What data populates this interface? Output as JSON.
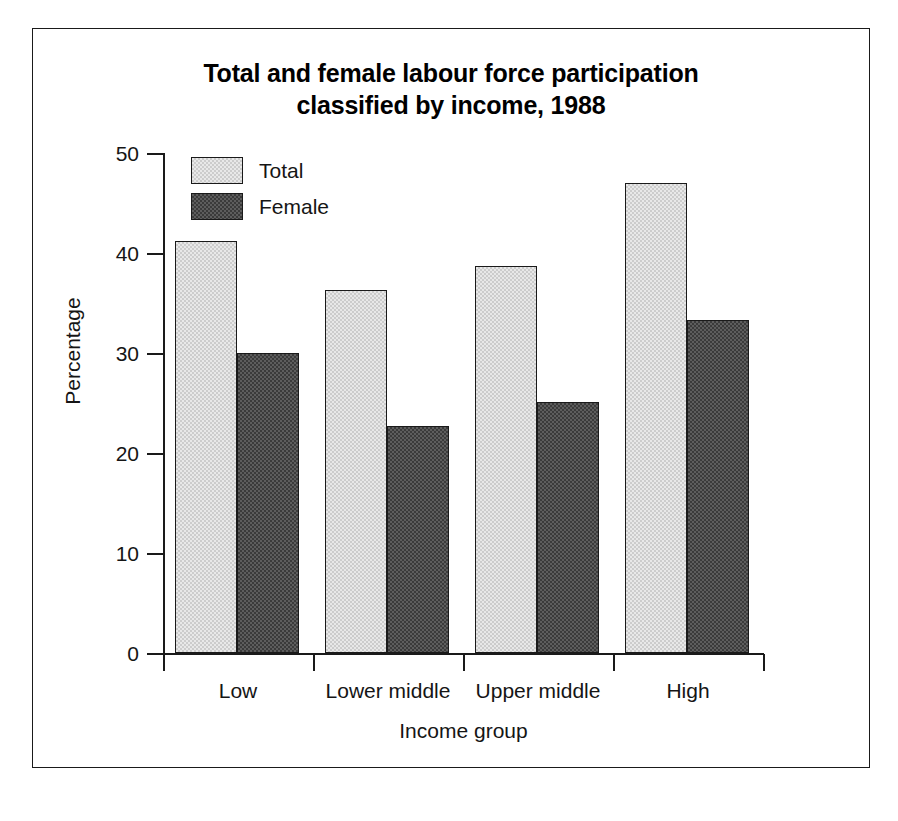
{
  "chart_data": {
    "type": "bar",
    "title": "Total and female labour force participation classified by income, 1988",
    "title_lines": [
      "Total and female labour force participation",
      "classified by income, 1988"
    ],
    "xlabel": "Income group",
    "ylabel": "Percentage",
    "categories": [
      "Low",
      "Lower middle",
      "Upper middle",
      "High"
    ],
    "series": [
      {
        "name": "Total",
        "values": [
          41.2,
          36.3,
          38.7,
          47.0
        ],
        "color": "#e8e8e8"
      },
      {
        "name": "Female",
        "values": [
          30.0,
          22.7,
          25.1,
          33.3
        ],
        "color": "#5d5d5d"
      }
    ],
    "ylim": [
      0,
      50
    ],
    "yticks": [
      0,
      10,
      20,
      30,
      40,
      50
    ],
    "ytick_labels": [
      "0",
      "10",
      "20",
      "30",
      "40",
      "50"
    ],
    "grid": false,
    "legend_position": "upper-left-inside",
    "frame": true
  },
  "axes": {
    "y_ticks": [
      {
        "value": 50,
        "label": "50"
      },
      {
        "value": 40,
        "label": "40"
      },
      {
        "value": 30,
        "label": "30"
      },
      {
        "value": 20,
        "label": "20"
      },
      {
        "value": 10,
        "label": "10"
      },
      {
        "value": 0,
        "label": "0"
      }
    ],
    "x_ticks": [
      {
        "label": "Low"
      },
      {
        "label": "Lower middle"
      },
      {
        "label": "Upper middle"
      },
      {
        "label": "High"
      }
    ]
  },
  "legend": {
    "items": [
      {
        "label": "Total",
        "swatch": "light-hatched"
      },
      {
        "label": "Female",
        "swatch": "dark-hatched"
      }
    ]
  }
}
